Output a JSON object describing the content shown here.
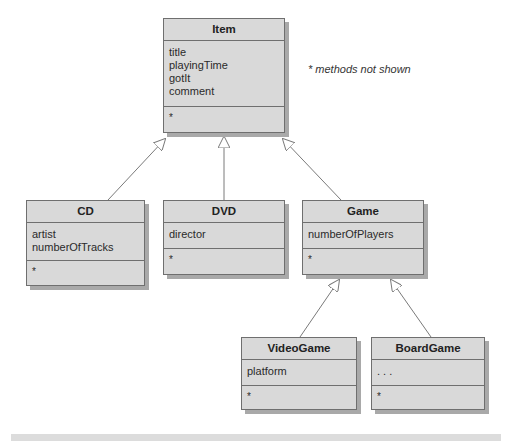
{
  "diagram": {
    "type": "UML class hierarchy",
    "note": "* methods not shown",
    "classes": {
      "item": {
        "name": "Item",
        "fields": [
          "title",
          "playingTime",
          "gotIt",
          "comment"
        ],
        "methods": [
          "*"
        ]
      },
      "cd": {
        "name": "CD",
        "fields": [
          "artist",
          "numberOfTracks"
        ],
        "methods": [
          "*"
        ]
      },
      "dvd": {
        "name": "DVD",
        "fields": [
          "director"
        ],
        "methods": [
          "*"
        ]
      },
      "game": {
        "name": "Game",
        "fields": [
          "numberOfPlayers"
        ],
        "methods": [
          "*"
        ]
      },
      "videogame": {
        "name": "VideoGame",
        "fields": [
          "platform"
        ],
        "methods": [
          "*"
        ]
      },
      "boardgame": {
        "name": "BoardGame",
        "fields": [
          ". . ."
        ],
        "methods": [
          "*"
        ]
      }
    },
    "relations": [
      {
        "from": "CD",
        "to": "Item",
        "kind": "inheritance"
      },
      {
        "from": "DVD",
        "to": "Item",
        "kind": "inheritance"
      },
      {
        "from": "Game",
        "to": "Item",
        "kind": "inheritance"
      },
      {
        "from": "VideoGame",
        "to": "Game",
        "kind": "inheritance"
      },
      {
        "from": "BoardGame",
        "to": "Game",
        "kind": "inheritance"
      }
    ],
    "colors": {
      "box_fill": "#d9d9d9",
      "box_border": "#6f6f6f",
      "shadow": "#a9a9a9",
      "line": "#7a7a7a"
    }
  }
}
